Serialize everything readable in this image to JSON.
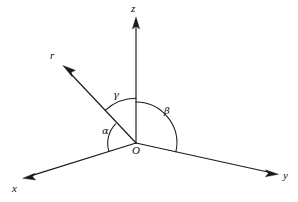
{
  "figure": {
    "kind": "3d-coordinate-axes-direction-cosines",
    "background_color": "#ffffff",
    "stroke_color": "#1a1a1a",
    "origin_label": "O",
    "axes": [
      {
        "name": "x-axis",
        "label": "x",
        "label_x": 12,
        "label_y": 184,
        "tip_x": 23,
        "tip_y": 178
      },
      {
        "name": "y-axis",
        "label": "y",
        "label_x": 283,
        "label_y": 171,
        "tip_x": 278,
        "tip_y": 174
      },
      {
        "name": "z-axis",
        "label": "z",
        "label_x": 131,
        "label_y": 4,
        "tip_x": 136,
        "tip_y": 18
      },
      {
        "name": "r-vector",
        "label": "r",
        "label_x": 50,
        "label_y": 51,
        "tip_x": 63,
        "tip_y": 66
      }
    ],
    "angles": [
      {
        "name": "alpha",
        "label": "α",
        "between": "r and x-axis",
        "label_x": 102,
        "label_y": 127
      },
      {
        "name": "beta",
        "label": "β",
        "between": "r and y-axis",
        "label_x": 164,
        "label_y": 107
      },
      {
        "name": "gamma",
        "label": "γ",
        "between": "r and z-axis",
        "label_x": 113,
        "label_y": 91
      }
    ],
    "origin": {
      "x": 136,
      "y": 143,
      "label_x": 132,
      "label_y": 146
    }
  }
}
